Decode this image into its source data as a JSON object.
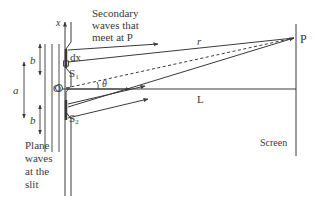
{
  "diagram": {
    "labels": {
      "x_axis": "x",
      "secondary_waves_line1": "Secondary",
      "secondary_waves_line2": "waves that",
      "secondary_waves_line3": "meet at P",
      "dx": "dx",
      "s1": "S",
      "s1_sub": "1",
      "s2": "S",
      "s2_sub": "2",
      "origin": "O",
      "theta": "θ",
      "r": "r",
      "point_p": "P",
      "distance_l": "L",
      "screen": "Screen",
      "a": "a",
      "b_top": "b",
      "b_bottom": "b",
      "plane_waves_line1": "Plane",
      "plane_waves_line2": "waves",
      "plane_waves_line3": "at the",
      "plane_waves_line4": "slit"
    },
    "colors": {
      "ink": "#3a3a3a",
      "background": "#ffffff"
    }
  }
}
